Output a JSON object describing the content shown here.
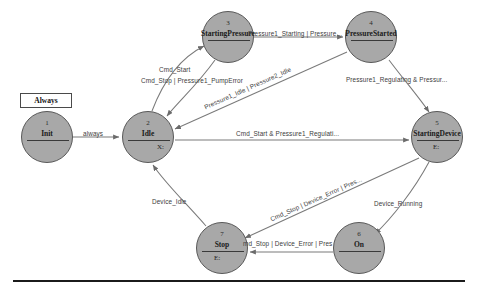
{
  "diagram": {
    "type": "state-machine",
    "always_box_label": "Always",
    "nodes": [
      {
        "id": "1",
        "name": "Init",
        "sub": "",
        "cx": 47,
        "cy": 137,
        "r": 26
      },
      {
        "id": "2",
        "name": "Idle",
        "sub": "X:",
        "cx": 148,
        "cy": 137,
        "r": 26
      },
      {
        "id": "3",
        "name": "StartingPressure",
        "sub": "",
        "cx": 228,
        "cy": 37,
        "r": 26
      },
      {
        "id": "4",
        "name": "PressureStarted",
        "sub": "",
        "cx": 371,
        "cy": 37,
        "r": 26
      },
      {
        "id": "5",
        "name": "StartingDevice",
        "sub": "E:",
        "cx": 437,
        "cy": 137,
        "r": 26
      },
      {
        "id": "6",
        "name": "On",
        "sub": "",
        "cx": 359,
        "cy": 248,
        "r": 26
      },
      {
        "id": "7",
        "name": "Stop",
        "sub": "E:",
        "cx": 222,
        "cy": 248,
        "r": 26
      }
    ],
    "edges": [
      {
        "from": "1",
        "to": "2",
        "label": "always"
      },
      {
        "from": "2",
        "to": "3",
        "label": "Cmd_Start"
      },
      {
        "from": "3",
        "to": "2",
        "label": "Cmd_Stop | Pressure1_PumpError"
      },
      {
        "from": "3",
        "to": "4",
        "label": "Pressure1_Starting | Pressure..."
      },
      {
        "from": "4",
        "to": "2",
        "label": "Pressure1_Idle | Pressure2_Idle"
      },
      {
        "from": "4",
        "to": "5",
        "label": "Pressure1_Regulating & Pressur..."
      },
      {
        "from": "2",
        "to": "5",
        "label": "Cmd_Start & Pressure1_Regulati..."
      },
      {
        "from": "5",
        "to": "7",
        "label": "Cmd_Stop | Device_Error | Pres..."
      },
      {
        "from": "5",
        "to": "6",
        "label": "Device_Running"
      },
      {
        "from": "6",
        "to": "7",
        "label": "md_Stop | Device_Error | Pres"
      },
      {
        "from": "7",
        "to": "2",
        "label": "Device_Idle"
      }
    ]
  }
}
